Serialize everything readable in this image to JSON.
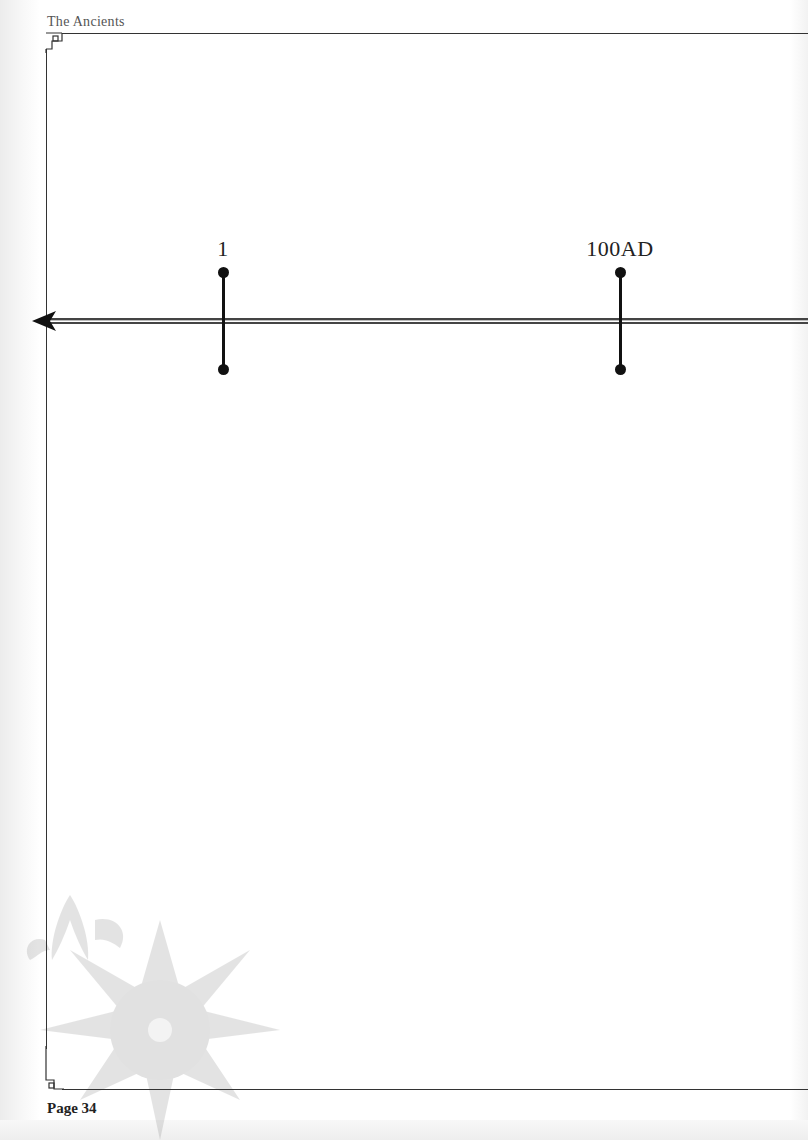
{
  "header": {
    "title": "The Ancients"
  },
  "timeline": {
    "markers": [
      {
        "label": "1",
        "x": 223
      },
      {
        "label": "100AD",
        "x": 620
      }
    ],
    "direction": "left"
  },
  "footer": {
    "page_label": "Page 34"
  }
}
